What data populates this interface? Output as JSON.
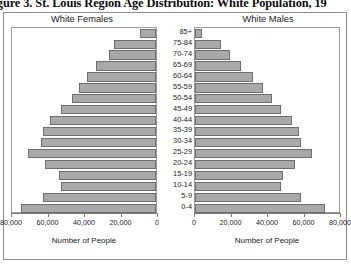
{
  "figure": {
    "caption": "Figure 3. St. Louis Region Age Distribution: White Population, 19",
    "left_panel_heading": "White Females",
    "right_panel_heading": "White Males"
  },
  "chart_data": {
    "type": "bar",
    "title": "Figure 3. St. Louis Region Age Distribution: White Population, 19",
    "orientation": "horizontal",
    "layout": "population-pyramid",
    "xlabel": "Number of People",
    "ylabel": "",
    "xlim": [
      0,
      80000
    ],
    "grid": false,
    "legend": "none",
    "bar_color": "#a9a9a9",
    "bar_border_color": "#6e6e6e",
    "categories": [
      "85+",
      "75-84",
      "70-74",
      "65-69",
      "60-64",
      "55-59",
      "50-54",
      "45-49",
      "40-44",
      "35-39",
      "30-34",
      "25-29",
      "20-24",
      "15-19",
      "10-14",
      "5-9",
      "0-4"
    ],
    "x_tick_labels_left": [
      "80,000",
      "60,000",
      "40,000",
      "20,000",
      "0"
    ],
    "x_tick_values_left": [
      80000,
      60000,
      40000,
      20000,
      0
    ],
    "x_tick_labels_right": [
      "0",
      "20,000",
      "40,000",
      "60,000",
      "80,000"
    ],
    "x_tick_values_right": [
      0,
      20000,
      40000,
      60000,
      80000
    ],
    "series": [
      {
        "name": "White Females",
        "axis": "left",
        "direction": "left",
        "xlabel": "Number of People",
        "values": [
          9000,
          23000,
          26000,
          33000,
          38000,
          42000,
          46000,
          52000,
          58000,
          62000,
          63000,
          70000,
          61000,
          53000,
          52000,
          62000,
          74000
        ]
      },
      {
        "name": "White Males",
        "axis": "right",
        "direction": "right",
        "xlabel": "Number of People",
        "values": [
          4000,
          14000,
          19000,
          25000,
          32000,
          37000,
          42000,
          47000,
          53000,
          57000,
          58000,
          64000,
          55000,
          48000,
          47000,
          58000,
          71000
        ]
      }
    ]
  }
}
